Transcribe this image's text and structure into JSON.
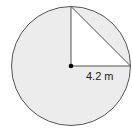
{
  "diagram": {
    "shape": "circle with inscribed right triangle (sector region)",
    "radius_label": "4.2 m",
    "colors": {
      "fill": "#ececec",
      "triangle_fill": "#ffffff",
      "stroke": "#555555",
      "center_dot": "#000000"
    }
  }
}
